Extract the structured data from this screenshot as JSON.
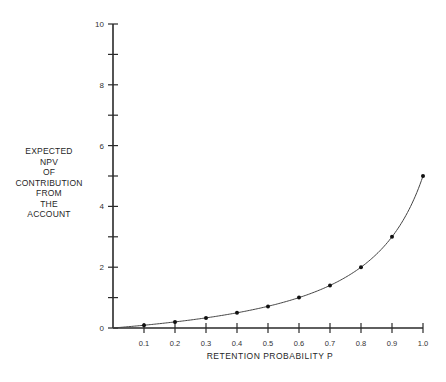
{
  "chart_data": {
    "type": "line",
    "title": "",
    "xlabel": "RETENTION PROBABILITY P",
    "ylabel_lines": [
      "EXPECTED",
      "NPV",
      "OF",
      "CONTRIBUTION",
      "FROM",
      "THE",
      "ACCOUNT"
    ],
    "x": [
      0.0,
      0.1,
      0.2,
      0.3,
      0.4,
      0.5,
      0.6,
      0.7,
      0.8,
      0.9,
      1.0
    ],
    "series": [
      {
        "name": "Expected NPV",
        "values": [
          0.0,
          0.09,
          0.2,
          0.33,
          0.5,
          0.71,
          1.0,
          1.4,
          2.0,
          3.0,
          5.0
        ],
        "markers": true
      }
    ],
    "xlim": [
      0,
      1.0
    ],
    "ylim": [
      0,
      10
    ],
    "x_ticks": [
      0.1,
      0.2,
      0.3,
      0.4,
      0.5,
      0.6,
      0.7,
      0.8,
      0.9,
      1.0
    ],
    "x_tick_labels": [
      "0.1",
      "0.2",
      "0.3",
      "0.4",
      "0.5",
      "0.6",
      "0.7",
      "0.8",
      "0.9",
      "1.0"
    ],
    "y_ticks": [
      0,
      1,
      2,
      3,
      4,
      5,
      6,
      7,
      8,
      9,
      10
    ],
    "y_tick_labels": [
      "0",
      "",
      "2",
      "",
      "4",
      "",
      "6",
      "",
      "8",
      "",
      "10"
    ],
    "grid": false,
    "legend": "none"
  },
  "colors": {
    "axis": "#2a2a2a",
    "line": "#444444",
    "marker": "#111111"
  }
}
